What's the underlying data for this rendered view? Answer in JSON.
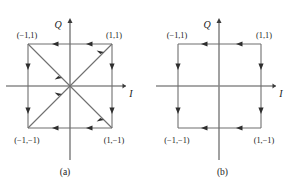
{
  "figure": {
    "type": "constellation-diagram-pair",
    "stroke_color": "#3a3a3a",
    "text_color": "#1a1a1a",
    "panels": [
      {
        "id": "a",
        "caption": "(a)",
        "axes": {
          "x_label": "I",
          "y_label": "Q"
        },
        "points": [
          {
            "name": "top-left",
            "label": "(−1,1)",
            "i": -1,
            "q": 1
          },
          {
            "name": "top-right",
            "label": "(1,1)",
            "i": 1,
            "q": 1
          },
          {
            "name": "bottom-left",
            "label": "(−1,−1)",
            "i": -1,
            "q": -1
          },
          {
            "name": "bottom-right",
            "label": "(1,−1)",
            "i": 1,
            "q": -1
          }
        ],
        "transitions": "square edges plus both diagonals (all state changes allowed, paths pass through origin)"
      },
      {
        "id": "b",
        "caption": "(b)",
        "axes": {
          "x_label": "I",
          "y_label": "Q"
        },
        "points": [
          {
            "name": "top-left",
            "label": "(−1,1)",
            "i": -1,
            "q": 1
          },
          {
            "name": "top-right",
            "label": "(1,1)",
            "i": 1,
            "q": 1
          },
          {
            "name": "bottom-left",
            "label": "(−1,−1)",
            "i": -1,
            "q": -1
          },
          {
            "name": "bottom-right",
            "label": "(1,−1)",
            "i": 1,
            "q": -1
          }
        ],
        "transitions": "square edges only (no diagonal transitions through origin)"
      }
    ]
  }
}
